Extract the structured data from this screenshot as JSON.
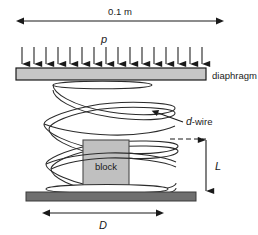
{
  "figure": {
    "type": "engineering-schematic",
    "labels": {
      "top_dimension": "0.1 m",
      "pressure": "p",
      "diaphragm": "diaphragm",
      "wire": "d-wire",
      "wire_symbol": "d",
      "wire_suffix": "-wire",
      "block": "block",
      "spring_length": "L",
      "spring_diameter": "D"
    },
    "components": {
      "diaphragm_bar": {
        "name": "diaphragm",
        "fill": "#c6c6c6",
        "stroke": "#1a1a1a"
      },
      "base_bar": {
        "name": "base",
        "fill": "#6f6f6f",
        "stroke": "#3a3a3a"
      },
      "block_body": {
        "name": "block",
        "fill": "#c0c0c0",
        "stroke": "#4a4a4a"
      },
      "spring": {
        "name": "helical-spring",
        "turns": 4,
        "stroke": "#2b2b2b",
        "fill": "#ffffff"
      }
    },
    "pressure_arrows": {
      "count": 16,
      "direction": "down",
      "color": "#1a1a1a"
    },
    "dimensions": [
      {
        "id": "width",
        "label": "0.1 m",
        "orientation": "horizontal",
        "position": "top"
      },
      {
        "id": "spring-length",
        "label": "L",
        "orientation": "vertical",
        "position": "right"
      },
      {
        "id": "spring-diameter",
        "label": "D",
        "orientation": "horizontal",
        "position": "bottom"
      }
    ],
    "colors": {
      "ink": "#1a1a1a",
      "diaphragm_fill": "#c6c6c6",
      "base_fill": "#6f6f6f",
      "block_fill": "#c0c0c0",
      "background": "#ffffff"
    }
  }
}
